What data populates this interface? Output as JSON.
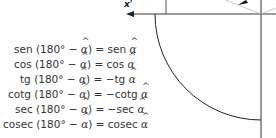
{
  "axis": {
    "x_neg_label": "x'"
  },
  "identities": [
    {
      "lhs_fn": "sen",
      "arg": "(180° − ",
      "angle": "α",
      "close": ") =",
      "rhs_fn": "sen",
      "rhs_sign": " "
    },
    {
      "lhs_fn": "cos",
      "arg": "(180° − ",
      "angle": "α",
      "close": ") =",
      "rhs_fn": "cos",
      "rhs_sign": " "
    },
    {
      "lhs_fn": "tg",
      "arg": "(180° − ",
      "angle": "α",
      "close": ") =",
      "rhs_fn": "tg",
      "rhs_sign": "−"
    },
    {
      "lhs_fn": "cotg",
      "arg": "(180° − ",
      "angle": "α",
      "close": ") =",
      "rhs_fn": "cotg",
      "rhs_sign": "−"
    },
    {
      "lhs_fn": "sec",
      "arg": "(180° − ",
      "angle": "α",
      "close": ") =",
      "rhs_fn": "sec",
      "rhs_sign": "−"
    },
    {
      "lhs_fn": "cosec",
      "arg": "(180° − ",
      "angle": "α",
      "close": ") =",
      "rhs_fn": "cosec",
      "rhs_sign": " "
    }
  ],
  "colors": {
    "line": "#222222",
    "text": "#333333",
    "radius_line": "#bbbbbb"
  }
}
